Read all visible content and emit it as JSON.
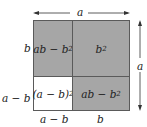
{
  "diagram": {
    "colors": {
      "shaded": "#a6a6a6",
      "unshaded": "#ffffff",
      "border": "#5a5a5a",
      "text": "#222222"
    },
    "top_dimension": {
      "label": "a",
      "arrow": "double-headed-horizontal"
    },
    "right_dimension": {
      "label": "a",
      "arrow": "double-headed-vertical"
    },
    "left_labels": {
      "top": "b",
      "bottom": "a − b"
    },
    "bottom_labels": {
      "left": "a − b",
      "right": "b"
    },
    "regions": {
      "top_left": {
        "base": "ab − b",
        "exp": "2",
        "shaded": true
      },
      "top_right": {
        "base": "b",
        "exp": "2",
        "shaded": true
      },
      "bottom_left": {
        "base": "(a − b)",
        "exp": "2",
        "shaded": false
      },
      "bottom_right": {
        "base": "ab − b",
        "exp": "2",
        "shaded": true
      }
    }
  }
}
